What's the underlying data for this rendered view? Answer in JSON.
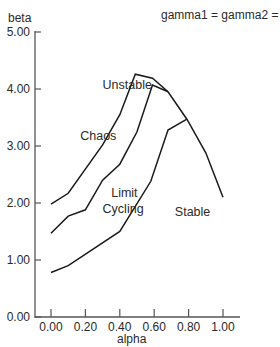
{
  "chart_data": {
    "type": "line",
    "title": "",
    "subtitle": "gamma1 = gamma2 = 1",
    "xlabel": "alpha",
    "ylabel": "beta",
    "xlim": [
      -0.1,
      1.1
    ],
    "ylim": [
      0.0,
      5.0
    ],
    "grid": false,
    "legend": null,
    "x_ticks": [
      0.0,
      0.2,
      0.4,
      0.6,
      0.8,
      1.0
    ],
    "x_tick_labels": [
      "0.00",
      "0.20",
      "0.40",
      "0.60",
      "0.80",
      "1.00"
    ],
    "y_ticks": [
      0.0,
      1.0,
      2.0,
      3.0,
      4.0,
      5.0
    ],
    "y_tick_labels": [
      "0.00",
      "1.00",
      "2.00",
      "3.00",
      "4.00",
      "5.00"
    ],
    "series": [
      {
        "name": "unstable-chaos boundary",
        "points": [
          [
            0.0,
            1.98
          ],
          [
            0.1,
            2.17
          ],
          [
            0.3,
            3.02
          ],
          [
            0.4,
            3.55
          ],
          [
            0.49,
            4.26
          ],
          [
            0.59,
            4.19
          ],
          [
            0.68,
            3.95
          ],
          [
            0.79,
            3.47
          ],
          [
            0.9,
            2.88
          ],
          [
            1.0,
            2.1
          ]
        ]
      },
      {
        "name": "chaos-limit cycling boundary",
        "points": [
          [
            0.0,
            1.47
          ],
          [
            0.1,
            1.77
          ],
          [
            0.2,
            1.88
          ],
          [
            0.3,
            2.4
          ],
          [
            0.4,
            2.68
          ],
          [
            0.5,
            3.25
          ],
          [
            0.59,
            4.07
          ],
          [
            0.68,
            3.95
          ]
        ]
      },
      {
        "name": "limit cycling-stable boundary",
        "points": [
          [
            0.0,
            0.78
          ],
          [
            0.1,
            0.9
          ],
          [
            0.4,
            1.5
          ],
          [
            0.58,
            2.38
          ],
          [
            0.68,
            3.28
          ],
          [
            0.79,
            3.47
          ]
        ]
      }
    ],
    "annotations": [
      {
        "text": "Unstable",
        "x": 0.3,
        "y": 4.0
      },
      {
        "text": "Chaos",
        "x": 0.17,
        "y": 3.1
      },
      {
        "text": "Limit",
        "x": 0.35,
        "y": 2.1
      },
      {
        "text": "Cycling",
        "x": 0.3,
        "y": 1.82
      },
      {
        "text": "Stable",
        "x": 0.72,
        "y": 1.78
      }
    ]
  },
  "colors": {
    "line": "#1a1a1a",
    "axis": "#555555",
    "background": "#ffffff"
  }
}
